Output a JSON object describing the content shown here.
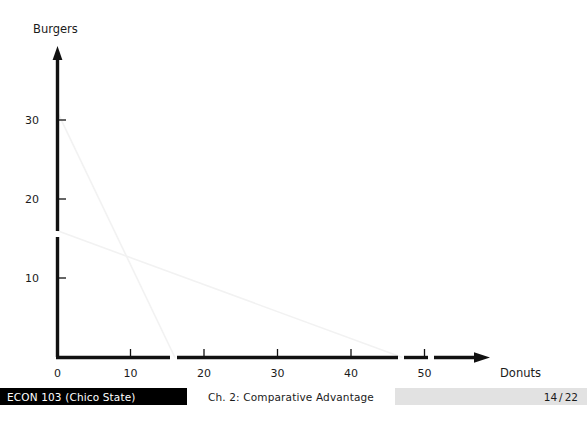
{
  "slide": {
    "chart_data": {
      "type": "line",
      "title": "",
      "xlabel": "Donuts",
      "ylabel": "Burgers",
      "xlim": [
        0,
        52
      ],
      "ylim": [
        0,
        33
      ],
      "grid": false,
      "legend": "none",
      "x_ticks": [
        0,
        10,
        20,
        30,
        40,
        50
      ],
      "x_tick_labels": [
        "0",
        "10",
        "20",
        "30",
        "40",
        "50"
      ],
      "y_ticks": [
        10,
        20,
        30
      ],
      "y_tick_labels": [
        "10",
        "20",
        "30"
      ],
      "series": [
        {
          "name": "steep-ppf",
          "color": "#f2f2f2",
          "x": [
            0,
            16
          ],
          "y": [
            31,
            0
          ]
        },
        {
          "name": "shallow-ppf",
          "color": "#f2f2f2",
          "x": [
            0,
            47
          ],
          "y": [
            16,
            0
          ]
        }
      ]
    },
    "axis_labels": {
      "y_axis_title": "Burgers",
      "x_axis_title": "Donuts",
      "origin_label": "0"
    }
  },
  "footer": {
    "course": "ECON 103  (Chico State)",
    "chapter": "Ch. 2:  Comparative Advantage",
    "page_current": "14",
    "page_separator": "/",
    "page_total": "22"
  },
  "colors": {
    "axis": "#111111",
    "text": "#1b1b1b",
    "footer_left_bg": "#000000",
    "footer_left_text": "#ffffff",
    "footer_right_bg": "#e2e2e2",
    "line_faint": "#f2f2f2"
  }
}
